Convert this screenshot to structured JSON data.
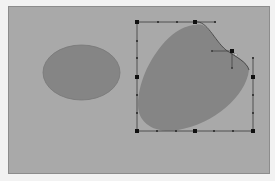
{
  "canvas": {
    "background": "#a9a9a9",
    "frame_border": "#8c8c8c",
    "page_background": "#f2f2f2"
  },
  "shapes": [
    {
      "id": "ellipse-left",
      "type": "ellipse",
      "fill": "#858585",
      "stroke": "#777777",
      "cx": 81.5,
      "cy": 72.5,
      "rx": 38.5,
      "ry": 27.5,
      "selected": false
    },
    {
      "id": "edited-blob-right",
      "type": "path",
      "fill": "#858585",
      "selected": true
    }
  ],
  "selection": {
    "outline_color": "#3a3a3a",
    "handle_color": "#111111",
    "note": "Selection frame is open at the top-right: top edge ends at x=215, right edge begins at y=58.",
    "edges": {
      "top": {
        "x1": 137,
        "x2": 215,
        "y": 22
      },
      "left": {
        "x": 137,
        "y1": 22,
        "y2": 131
      },
      "bottom": {
        "x1": 137,
        "x2": 253,
        "y": 131
      },
      "right": {
        "x": 253,
        "y1": 58,
        "y2": 131
      }
    },
    "big_handles": [
      {
        "x": 137,
        "y": 22
      },
      {
        "x": 195,
        "y": 22
      },
      {
        "x": 137,
        "y": 77
      },
      {
        "x": 253,
        "y": 77
      },
      {
        "x": 137,
        "y": 131
      },
      {
        "x": 195,
        "y": 131
      },
      {
        "x": 253,
        "y": 131
      }
    ],
    "small_ticks": [
      {
        "x": 158,
        "y": 22
      },
      {
        "x": 177,
        "y": 22
      },
      {
        "x": 215,
        "y": 22
      },
      {
        "x": 137,
        "y": 41
      },
      {
        "x": 137,
        "y": 58
      },
      {
        "x": 137,
        "y": 95
      },
      {
        "x": 137,
        "y": 113
      },
      {
        "x": 157,
        "y": 131
      },
      {
        "x": 176,
        "y": 131
      },
      {
        "x": 214,
        "y": 131
      },
      {
        "x": 233,
        "y": 131
      },
      {
        "x": 253,
        "y": 58
      },
      {
        "x": 253,
        "y": 95
      },
      {
        "x": 253,
        "y": 113
      }
    ],
    "bezier_anchor": {
      "x": 232,
      "y": 51
    },
    "bezier_handles": [
      {
        "x": 212,
        "y": 51
      },
      {
        "x": 232,
        "y": 68
      }
    ]
  }
}
